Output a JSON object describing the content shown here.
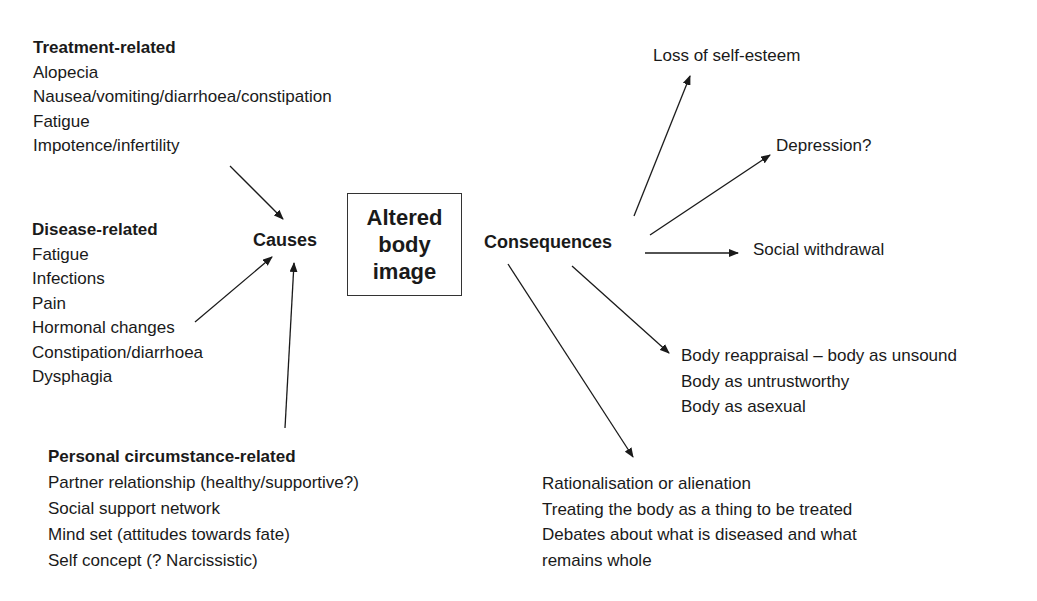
{
  "center": {
    "lines": [
      "Altered",
      "body",
      "image"
    ]
  },
  "causes_label": "Causes",
  "consequences_label": "Consequences",
  "treatment": {
    "heading": "Treatment-related",
    "items": [
      "Alopecia",
      "Nausea/vomiting/diarrhoea/constipation",
      "Fatigue",
      "Impotence/infertility"
    ]
  },
  "disease": {
    "heading": "Disease-related",
    "items": [
      "Fatigue",
      "Infections",
      "Pain",
      "Hormonal changes",
      "Constipation/diarrhoea",
      "Dysphagia"
    ]
  },
  "personal": {
    "heading": "Personal circumstance-related",
    "items": [
      "Partner relationship (healthy/supportive?)",
      "Social support network",
      "Mind set (attitudes towards fate)",
      "Self concept (? Narcissistic)"
    ]
  },
  "consequences": {
    "self_esteem": "Loss of self-esteem",
    "depression": "Depression?",
    "withdrawal": "Social withdrawal",
    "reappraisal": [
      "Body reappraisal – body as unsound",
      "Body as untrustworthy",
      "Body as asexual"
    ],
    "rationalisation": [
      "Rationalisation or alienation",
      "Treating the body as a thing to be treated",
      "Debates about what is diseased and what",
      "remains whole"
    ]
  }
}
